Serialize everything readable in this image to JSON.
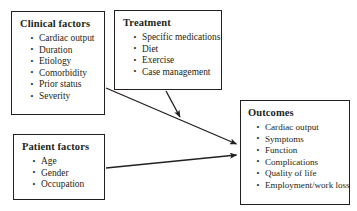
{
  "diagram": {
    "background_color": "#ffffff",
    "line_color": "#231f20",
    "text_color": "#231f20",
    "nodes": [
      {
        "id": "clinical-factors",
        "title": "Clinical factors",
        "items": [
          "Cardiac output",
          "Duration",
          "Etiology",
          "Comorbidity",
          "Prior status",
          "Severity"
        ]
      },
      {
        "id": "treatment",
        "title": "Treatment",
        "items": [
          "Specific medications",
          "Diet",
          "Exercise",
          "Case management"
        ]
      },
      {
        "id": "patient-factors",
        "title": "Patient factors",
        "items": [
          "Age",
          "Gender",
          "Occupation"
        ]
      },
      {
        "id": "outcomes",
        "title": "Outcomes",
        "items": [
          "Cardiac output",
          "Symptoms",
          "Function",
          "Complications",
          "Quality of life",
          "Employment/work loss"
        ]
      }
    ],
    "edges": [
      {
        "id": "clinical-to-outcomes",
        "from": "clinical-factors",
        "to": "outcomes",
        "style": "solid-arrow"
      },
      {
        "id": "treatment-to-clinical-outcomes-path",
        "from": "treatment",
        "to": "clinical-to-outcomes",
        "style": "solid-arrow"
      },
      {
        "id": "patient-to-outcomes",
        "from": "patient-factors",
        "to": "outcomes",
        "style": "solid-arrow"
      }
    ]
  }
}
